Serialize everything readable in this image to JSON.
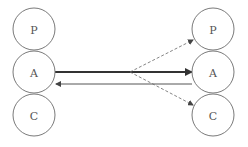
{
  "diagram": {
    "left_nodes": [
      {
        "id": "left-p",
        "label": "P",
        "cx": 34,
        "cy": 29
      },
      {
        "id": "left-a",
        "label": "A",
        "cx": 34,
        "cy": 72
      },
      {
        "id": "left-c",
        "label": "C",
        "cx": 34,
        "cy": 115
      }
    ],
    "right_nodes": [
      {
        "id": "right-p",
        "label": "P",
        "cx": 213,
        "cy": 29
      },
      {
        "id": "right-a",
        "label": "A",
        "cx": 213,
        "cy": 72
      },
      {
        "id": "right-c",
        "label": "C",
        "cx": 213,
        "cy": 115
      }
    ],
    "radius": 21,
    "edges": [
      {
        "from": "left-a",
        "to": "right-a",
        "style": "thick-solid"
      },
      {
        "from": "right-a",
        "to": "left-a",
        "style": "thin-solid"
      },
      {
        "from": "mid",
        "to": "right-p",
        "style": "dashed"
      },
      {
        "from": "mid",
        "to": "right-c",
        "style": "dashed"
      }
    ],
    "colors": {
      "stroke": "#7a7a7a",
      "thick_arrow": "#333333",
      "thin_arrow": "#555555",
      "dashed": "#666666"
    }
  }
}
